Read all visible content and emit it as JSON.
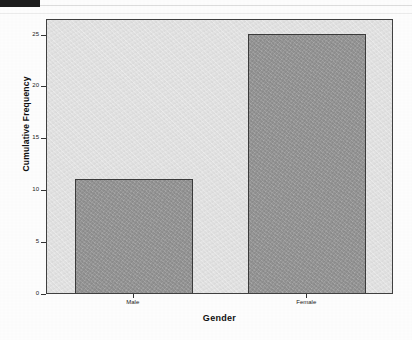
{
  "page": {
    "background_color": "#fdfdfd",
    "header_strip_color": "#1c1c1c"
  },
  "chart_data": {
    "type": "bar",
    "title": "",
    "xlabel": "Gender",
    "ylabel": "Cumulative Frequency",
    "categories": [
      "Male",
      "Female"
    ],
    "values": [
      11,
      25
    ],
    "ylim": [
      0,
      26.5
    ],
    "yticks": [
      0,
      5,
      10,
      15,
      20,
      25
    ],
    "ytick_labels": [
      "0",
      "5",
      "10",
      "15",
      "20",
      "25"
    ],
    "grid": false,
    "legend": null,
    "bar_fill_color": "#969696",
    "bar_border_color": "#3a3a3a",
    "plot_background_color": "#e2e2e2",
    "plot_border_color": "#404040"
  }
}
